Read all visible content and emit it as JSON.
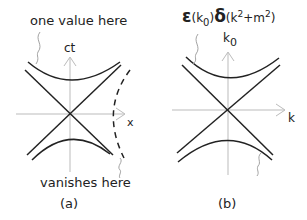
{
  "panel_a": {
    "annotation_top": "one value here",
    "annotation_bottom": "vanishes here",
    "axis_vertical": "ct",
    "axis_horizontal": "x",
    "caption": "(a)"
  },
  "panel_b": {
    "formula": {
      "eps": "ε",
      "eps_arg_open": "(k",
      "eps_arg_sub": "0",
      "eps_arg_close": ")",
      "delta": "δ",
      "delta_arg_open": "(k",
      "delta_arg_sup1": "2",
      "delta_arg_mid": "+m",
      "delta_arg_sup2": "2",
      "delta_arg_close": ")"
    },
    "axis_vertical": "k",
    "axis_vertical_sub": "0",
    "axis_horizontal": "k",
    "caption": "(b)"
  },
  "colors": {
    "curve": "#222222",
    "axis": "#bbbbbb",
    "annotation_arrow": "#999999"
  }
}
